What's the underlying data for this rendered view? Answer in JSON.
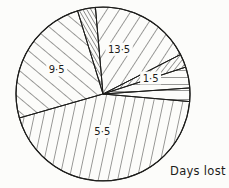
{
  "chart_data": {
    "type": "pie",
    "title": "Days lost",
    "caption": "Days lost",
    "decimal_separator": "middle-dot",
    "segments": [
      {
        "name": "segment-13-5",
        "label": "13·5",
        "value": 13.5,
        "start_angle": 355,
        "end_angle": 63,
        "hatch": {
          "angle": 33,
          "spacing": 10.5
        },
        "label_angle": 20,
        "label_radius": 47
      },
      {
        "name": "segment-small-right",
        "label": "",
        "value": null,
        "start_angle": 63,
        "end_angle": 72,
        "hatch": {
          "angle": 38,
          "spacing": 4.5
        },
        "label_angle": null,
        "label_radius": null
      },
      {
        "name": "segment-1-5",
        "label": "1·5",
        "value": 1.5,
        "start_angle": 72,
        "end_angle": 86,
        "hatch": {
          "angle": 90,
          "spacing": 7
        },
        "label_angle": 72,
        "label_radius": 50
      },
      {
        "name": "segment-sliver",
        "label": "",
        "value": null,
        "start_angle": 86,
        "end_angle": 95,
        "hatch": {
          "angle": 90,
          "spacing": 9
        },
        "label_angle": null,
        "label_radius": null
      },
      {
        "name": "segment-5-5",
        "label": "5·5",
        "value": 5.5,
        "start_angle": 95,
        "end_angle": 254,
        "hatch": {
          "angle": 12,
          "spacing": 9.5
        },
        "label_angle": 181,
        "label_radius": 38
      },
      {
        "name": "segment-9-5",
        "label": "9·5",
        "value": 9.5,
        "start_angle": 254,
        "end_angle": 343,
        "hatch": {
          "angle": -50,
          "spacing": 10.5
        },
        "label_angle": 297,
        "label_radius": 52
      },
      {
        "name": "segment-small-top",
        "label": "",
        "value": null,
        "start_angle": 343,
        "end_angle": 355,
        "hatch": {
          "angle": -30,
          "spacing": 3.5
        },
        "label_angle": null,
        "label_radius": null
      }
    ],
    "geometry": {
      "cx": 103,
      "cy": 94,
      "r": 87,
      "angle_convention": "degrees clockwise from 12 o'clock"
    },
    "ink_color": "#1d1d1b",
    "bg_color": "#fcfcfa",
    "legend": "none",
    "grid": false
  }
}
